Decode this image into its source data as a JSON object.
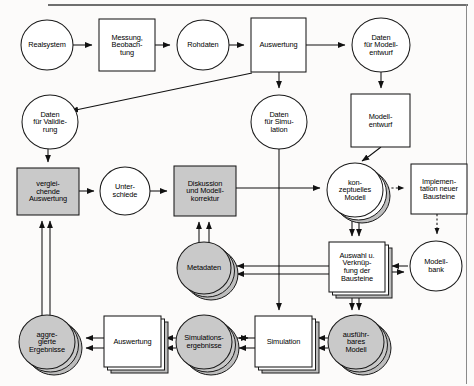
{
  "diagram": {
    "language": "de",
    "frame": {
      "top_rule": true,
      "right_rule": true
    },
    "colors": {
      "stroke": "#1a1a1a",
      "shaded_fill": "#c9c9c9",
      "plain_fill": "#ffffff",
      "shadow_fill": "#bdbdbd",
      "frame_rule": "#6f6f6f"
    },
    "nodes": [
      {
        "id": "realsystem",
        "label": "Realsystem",
        "shape": "circle",
        "shaded": false,
        "stacked": false,
        "cx": 47,
        "cy": 45,
        "rx": 26,
        "ry": 25
      },
      {
        "id": "messung",
        "label": "Messung,\nBeobach-\ntung",
        "shape": "rect",
        "shaded": false,
        "stacked": false,
        "x": 99,
        "y": 19,
        "w": 56,
        "h": 52
      },
      {
        "id": "rohdaten",
        "label": "Rohdaten",
        "shape": "circle",
        "shaded": false,
        "stacked": false,
        "cx": 203,
        "cy": 45,
        "rx": 26,
        "ry": 25
      },
      {
        "id": "auswertung1",
        "label": "Auswertung",
        "shape": "rect",
        "shaded": false,
        "stacked": false,
        "x": 251,
        "y": 18,
        "w": 55,
        "h": 54
      },
      {
        "id": "datenmodell",
        "label": "Daten\nfür Modell-\nentwurf",
        "shape": "circle",
        "shaded": false,
        "stacked": false,
        "cx": 381,
        "cy": 45,
        "rx": 29,
        "ry": 27
      },
      {
        "id": "datenvalid",
        "label": "Daten\nfür Validie-\nrung",
        "shape": "circle",
        "shaded": false,
        "stacked": false,
        "cx": 50,
        "cy": 122,
        "rx": 28,
        "ry": 27
      },
      {
        "id": "datensim",
        "label": "Daten\nfür Simu-\nlation",
        "shape": "circle",
        "shaded": false,
        "stacked": false,
        "cx": 279,
        "cy": 122,
        "rx": 28,
        "ry": 27
      },
      {
        "id": "modellentwurf",
        "label": "Modell-\nentwurf",
        "shape": "rect",
        "shaded": false,
        "stacked": false,
        "x": 351,
        "y": 94,
        "w": 59,
        "h": 53
      },
      {
        "id": "vergleichende",
        "label": "verglei-\nchende\nAuswertung",
        "shape": "rect",
        "shaded": true,
        "stacked": false,
        "x": 17,
        "y": 168,
        "w": 62,
        "h": 47
      },
      {
        "id": "unterschiede",
        "label": "Unter-\nschiede",
        "shape": "circle",
        "shaded": false,
        "stacked": false,
        "cx": 125,
        "cy": 191,
        "rx": 25,
        "ry": 24
      },
      {
        "id": "diskussion",
        "label": "Diskussion\nund Modell-\nkorrektur",
        "shape": "rect",
        "shaded": true,
        "stacked": false,
        "x": 174,
        "y": 166,
        "w": 62,
        "h": 50
      },
      {
        "id": "konzeptuell",
        "label": "kon-\nzeptuelles\nModell",
        "shape": "circle",
        "shaded": false,
        "stacked": true,
        "cx": 355,
        "cy": 190,
        "rx": 28,
        "ry": 27
      },
      {
        "id": "implementation",
        "label": "Implemen-\ntation neuer\nBausteine",
        "shape": "rect",
        "shaded": false,
        "stacked": false,
        "x": 411,
        "y": 164,
        "w": 56,
        "h": 50
      },
      {
        "id": "metadaten",
        "label": "Metadaten",
        "shape": "circle",
        "shaded": true,
        "stacked": true,
        "cx": 204,
        "cy": 268,
        "rx": 27,
        "ry": 26
      },
      {
        "id": "auswahl",
        "label": "Auswahl u.\nVerknüp-\nfung der\nBausteine",
        "shape": "rect",
        "shaded": false,
        "stacked": true,
        "x": 329,
        "y": 242,
        "w": 56,
        "h": 50
      },
      {
        "id": "modellbank",
        "label": "Modell-\nbank",
        "shape": "circle",
        "shaded": false,
        "stacked": false,
        "cx": 436,
        "cy": 266,
        "rx": 26,
        "ry": 25
      },
      {
        "id": "aggregierte",
        "label": "aggre-\ngierte\nErgebnisse",
        "shape": "circle",
        "shaded": true,
        "stacked": true,
        "cx": 47,
        "cy": 342,
        "rx": 28,
        "ry": 27
      },
      {
        "id": "auswertung2",
        "label": "Auswertung",
        "shape": "rect",
        "shaded": false,
        "stacked": true,
        "x": 104,
        "y": 316,
        "w": 57,
        "h": 51
      },
      {
        "id": "simerg",
        "label": "Simulations-\nergebnisse",
        "shape": "circle",
        "shaded": true,
        "stacked": true,
        "cx": 204,
        "cy": 342,
        "rx": 28,
        "ry": 27
      },
      {
        "id": "simulation",
        "label": "Simulation",
        "shape": "rect",
        "shaded": false,
        "stacked": true,
        "x": 255,
        "y": 316,
        "w": 57,
        "h": 51
      },
      {
        "id": "ausfuehrbar",
        "label": "ausführ-\nbares\nModell",
        "shape": "circle",
        "shaded": true,
        "stacked": true,
        "cx": 356,
        "cy": 342,
        "rx": 28,
        "ry": 27
      }
    ],
    "edges": [
      {
        "from": "realsystem",
        "to": "messung",
        "style": "solid",
        "note": "Realsystem -> Messung, Beobachtung"
      },
      {
        "from": "messung",
        "to": "rohdaten",
        "style": "solid",
        "note": "Messung -> Rohdaten"
      },
      {
        "from": "rohdaten",
        "to": "auswertung1",
        "style": "solid",
        "note": "Rohdaten -> Auswertung"
      },
      {
        "from": "auswertung1",
        "to": "datenmodell",
        "style": "solid",
        "note": "Auswertung -> Daten für Modellentwurf"
      },
      {
        "from": "auswertung1",
        "to": "datenvalid",
        "style": "solid",
        "note": "Auswertung (unten links) -> Daten für Validierung, diagonal"
      },
      {
        "from": "auswertung1",
        "to": "datensim",
        "style": "solid",
        "note": "Auswertung -> Daten für Simulation"
      },
      {
        "from": "datenmodell",
        "to": "modellentwurf",
        "style": "solid",
        "note": "Daten für Modellentwurf -> Modellentwurf"
      },
      {
        "from": "modellentwurf",
        "to": "konzeptuell",
        "style": "solid",
        "note": "Modellentwurf -> konzeptuelles Modell"
      },
      {
        "from": "datenvalid",
        "to": "vergleichende",
        "style": "solid",
        "note": "Daten für Validierung -> vergleichende Auswertung"
      },
      {
        "from": "vergleichende",
        "to": "unterschiede",
        "style": "solid",
        "note": "vergleichende Auswertung -> Unterschiede"
      },
      {
        "from": "unterschiede",
        "to": "diskussion",
        "style": "solid",
        "note": "Unterschiede -> Diskussion und Modellkorrektur"
      },
      {
        "from": "diskussion",
        "to": "konzeptuell",
        "style": "solid",
        "note": "Diskussion und Modellkorrektur -> konzeptuelles Modell"
      },
      {
        "from": "metadaten",
        "to": "diskussion",
        "style": "solid",
        "note": "Metadaten -> Diskussion (Doppelpfeil nach oben)"
      },
      {
        "from": "konzeptuell",
        "to": "implementation",
        "style": "dashed",
        "note": "konzeptuelles Modell --> Implementation neuer Bausteine"
      },
      {
        "from": "implementation",
        "to": "modellbank",
        "style": "dashed",
        "note": "Implementation neuer Bausteine --> Modellbank"
      },
      {
        "from": "konzeptuell",
        "to": "auswahl",
        "style": "solid",
        "note": "konzeptuelles Modell -> Auswahl u. Verknüpfung der Bausteine"
      },
      {
        "from": "modellbank",
        "to": "auswahl",
        "style": "solid",
        "note": "Modellbank <-> Auswahl u. Verknüpfung (Doppelpfeil)"
      },
      {
        "from": "auswahl",
        "to": "ausfuehrbar",
        "style": "solid",
        "note": "Auswahl u. Verknüpfung -> ausführbares Modell"
      },
      {
        "from": "datensim",
        "to": "simulation",
        "style": "solid",
        "note": "Daten für Simulation -> Simulation (lange Linie nach unten)"
      },
      {
        "from": "ausfuehrbar",
        "to": "simulation",
        "style": "solid",
        "note": "ausführbares Modell -> Simulation"
      },
      {
        "from": "simulation",
        "to": "simerg",
        "style": "solid",
        "note": "Simulation -> Simulationsergebnisse"
      },
      {
        "from": "simerg",
        "to": "auswertung2",
        "style": "solid",
        "note": "Simulationsergebnisse -> Auswertung"
      },
      {
        "from": "auswertung2",
        "to": "aggregierte",
        "style": "solid",
        "note": "Auswertung -> aggregierte Ergebnisse"
      },
      {
        "from": "aggregierte",
        "to": "vergleichende",
        "style": "solid",
        "note": "aggregierte Ergebnisse -> vergleichende Auswertung (Doppellinie)"
      },
      {
        "from": "auswahl",
        "to": "metadaten",
        "style": "solid",
        "note": "Auswahl u. Verknüpfung -> Metadaten (lange Linie nach links)"
      },
      {
        "from": "simerg",
        "to": "metadaten",
        "style": "solid",
        "note": "Rückfluss in Metadaten"
      }
    ]
  }
}
